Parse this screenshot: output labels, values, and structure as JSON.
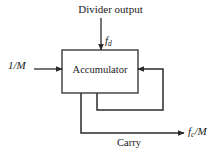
{
  "figure": {
    "type": "block-diagram",
    "background_color": "#ffffff",
    "line_color": "#2b2b2b"
  },
  "labels": {
    "divider_output": "Divider output",
    "accumulator": "Accumulator",
    "input_one_over_m": "1/M",
    "carry": "Carry",
    "fd_base": "f",
    "fd_sub": "d",
    "fc_base": "f",
    "fc_sub": "c",
    "fc_suffix": "/M"
  },
  "blocks": [
    {
      "name": "accumulator",
      "label": "Accumulator",
      "x": 62,
      "y": 50,
      "width": 76,
      "height": 43
    }
  ],
  "signals": [
    {
      "name": "divider-output-input",
      "label": "Divider output",
      "signal": "f_d",
      "direction": "down",
      "from": [
        101,
        18
      ],
      "to": [
        101,
        50
      ],
      "arrow": true
    },
    {
      "name": "one-over-m-input",
      "label": "1/M",
      "direction": "right",
      "from": [
        34,
        69
      ],
      "to": [
        62,
        69
      ],
      "arrow": true
    },
    {
      "name": "feedback-loop",
      "label": "",
      "direction": "left",
      "path": [
        [
          97,
          93
        ],
        [
          97,
          110
        ],
        [
          163,
          110
        ],
        [
          163,
          69
        ],
        [
          138,
          69
        ]
      ],
      "arrow": true
    },
    {
      "name": "carry-output",
      "label": "Carry",
      "signal": "f_c/M",
      "direction": "right",
      "path": [
        [
          81,
          93
        ],
        [
          81,
          133
        ],
        [
          184,
          133
        ]
      ],
      "arrow": true
    }
  ]
}
